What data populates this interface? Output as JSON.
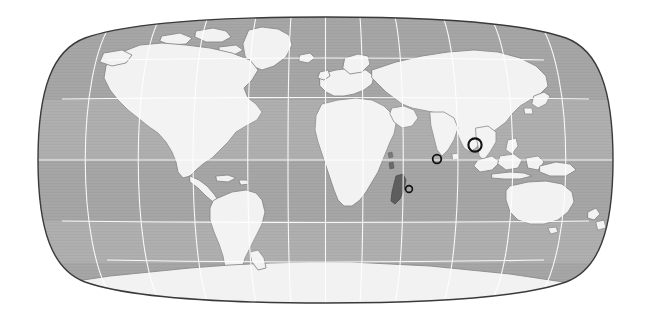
{
  "figure": {
    "type": "world-map",
    "projection": "robinson",
    "width": 652,
    "height": 329,
    "background_color": "#ffffff",
    "caption": ""
  },
  "map": {
    "frame": {
      "left": 38,
      "top": 17,
      "right": 613,
      "bottom": 303,
      "outline_color": "#3a3a3a",
      "outline_width": 1.4
    },
    "colors": {
      "ocean": "#a6a6a6",
      "ocean_shade": "#9e9e9e",
      "land": "#f2f2f2",
      "land_outline": "#8a8a8a",
      "highlight_land": "#5e5e5e",
      "graticule": "#ffffff",
      "marker_stroke": "#111111",
      "background": "#ffffff"
    },
    "graticule": {
      "visible": true,
      "latitude_interval_deg": 30,
      "longitude_interval_deg": 30,
      "latitude_labels": [
        "60N",
        "30N",
        "0",
        "30S",
        "60S"
      ],
      "longitude_labels": [
        "180W",
        "150W",
        "120W",
        "90W",
        "60W",
        "30W",
        "0",
        "30E",
        "60E",
        "90E",
        "120E",
        "150E",
        "180E"
      ],
      "central_meridian_deg": 0,
      "line_color": "#ffffff",
      "line_width": 1.1
    },
    "highlighted_regions": [
      {
        "name": "madagascar",
        "label": "Madagascar",
        "fill": "#5e5e5e"
      }
    ]
  },
  "markers": [
    {
      "id": "marker-andaman",
      "label": "Andaman Sea / Nicobar",
      "cx": 475,
      "cy": 145,
      "radius": 6.6,
      "stroke_width": 2.1,
      "size_class": "large"
    },
    {
      "id": "marker-central-indian-ocean",
      "label": "Central Indian Ocean",
      "cx": 437,
      "cy": 159,
      "radius": 4.3,
      "stroke_width": 1.8,
      "size_class": "medium"
    },
    {
      "id": "marker-south-madagascar",
      "label": "South of Madagascar",
      "cx": 409,
      "cy": 189,
      "radius": 3.4,
      "stroke_width": 1.6,
      "size_class": "small"
    }
  ],
  "landmasses": [
    {
      "id": "north-america",
      "label": "North America"
    },
    {
      "id": "south-america",
      "label": "South America"
    },
    {
      "id": "greenland",
      "label": "Greenland"
    },
    {
      "id": "europe",
      "label": "Europe"
    },
    {
      "id": "africa",
      "label": "Africa"
    },
    {
      "id": "asia",
      "label": "Asia"
    },
    {
      "id": "india",
      "label": "India"
    },
    {
      "id": "indonesia",
      "label": "Indonesia"
    },
    {
      "id": "australia",
      "label": "Australia"
    },
    {
      "id": "new-zealand",
      "label": "New Zealand"
    },
    {
      "id": "japan",
      "label": "Japan"
    },
    {
      "id": "antarctica",
      "label": "Antarctica"
    },
    {
      "id": "madagascar",
      "label": "Madagascar"
    },
    {
      "id": "british-isles",
      "label": "British Isles"
    },
    {
      "id": "iceland",
      "label": "Iceland"
    }
  ]
}
